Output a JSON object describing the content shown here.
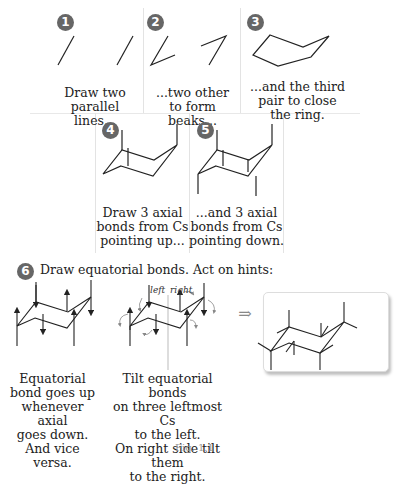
{
  "steps": [
    {
      "number": "1",
      "caption": "Draw two\nparallel lines..."
    },
    {
      "number": "2",
      "caption": "...two other\nto form beaks..."
    },
    {
      "number": "3",
      "caption": "...and the third\npair to close\nthe ring."
    },
    {
      "number": "4",
      "caption": "Draw 3 axial\nbonds from Cs\npointing up..."
    },
    {
      "number": "5",
      "caption": "...and 3 axial\nbonds from Cs\npointing down."
    },
    {
      "number": "6",
      "caption": "Draw equatorial bonds. Act on hints:"
    }
  ],
  "step6": {
    "hint_left_caption": "Equatorial\nbond goes up\nwhenever axial\ngoes down.\nAnd vice versa.",
    "hint_right_caption": "Tilt equatorial bonds\non three leftmost Cs\nto the left.\nOn right side tilt them\nto the right.",
    "divider_left_label": "left",
    "divider_right_label": "right",
    "arrow_symbol": "⇒"
  },
  "figure_caption": "Fig. 1.1",
  "colors": {
    "badge": "#666666",
    "line": "#222222",
    "divider": "#e3e3e3",
    "hint_arrows": "#888888"
  }
}
